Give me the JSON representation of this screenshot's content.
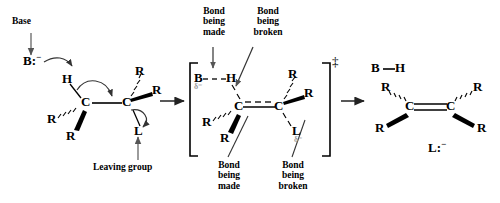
{
  "diagram": {
    "type": "reaction-mechanism",
    "ink_color": "#000000",
    "delta_color": "#9a9a9a"
  },
  "annotations": {
    "base": "Base",
    "leaving_group": "Leaving group",
    "bond_made_top": "Bond\nbeing\nmade",
    "bond_broken_top": "Bond\nbeing\nbroken",
    "bond_made_bottom": "Bond\nbeing\nmade",
    "bond_broken_bottom": "Bond\nbeing\nbroken"
  },
  "reactant": {
    "base_label": "B:",
    "base_charge": "−",
    "hydrogen": "H",
    "carbon_left": "C",
    "carbon_right": "C",
    "r_left_dashed": "R",
    "r_left_wedge": "R",
    "r_right_dashed": "R",
    "r_right_wedge": "R",
    "leaving": "L"
  },
  "transition_state": {
    "dagger": "‡",
    "base_label": "B",
    "base_delta": "δ⁻",
    "hydrogen": "H",
    "carbon_left": "C",
    "carbon_right": "C",
    "r_left_dashed": "R",
    "r_left_wedge": "R",
    "r_right_dashed": "R",
    "r_right_wedge": "R",
    "leaving": "L",
    "leaving_delta": "δ⁻",
    "bracket_left": "[",
    "bracket_right": "]"
  },
  "product": {
    "conjugate_acid_b": "B",
    "conjugate_acid_h": "H",
    "carbon_left": "C",
    "carbon_right": "C",
    "r_top_left": "R",
    "r_bottom_left": "R",
    "r_top_right": "R",
    "r_bottom_right": "R",
    "leaving_anion": "L:",
    "leaving_anion_charge": "−"
  }
}
